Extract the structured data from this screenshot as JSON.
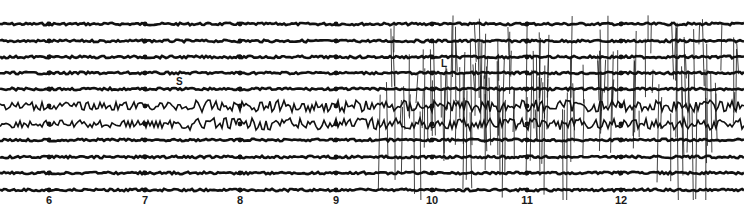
{
  "figure": {
    "type": "seismogram",
    "colors": {
      "background": "#ffffff",
      "ink": "#111111"
    },
    "trace_baselines_y": [
      24,
      41,
      57,
      73,
      89,
      106,
      124,
      140,
      157,
      173,
      190
    ],
    "minute_marks": [
      {
        "label": "6",
        "x": 49
      },
      {
        "label": "7",
        "x": 145
      },
      {
        "label": "8",
        "x": 240
      },
      {
        "label": "9",
        "x": 336
      },
      {
        "label": "10",
        "x": 432
      },
      {
        "label": "11",
        "x": 527
      },
      {
        "label": "12",
        "x": 621
      }
    ],
    "phase_labels": [
      {
        "label": "S",
        "x": 176,
        "y": 76
      },
      {
        "label": "L",
        "x": 441,
        "y": 58
      }
    ]
  }
}
